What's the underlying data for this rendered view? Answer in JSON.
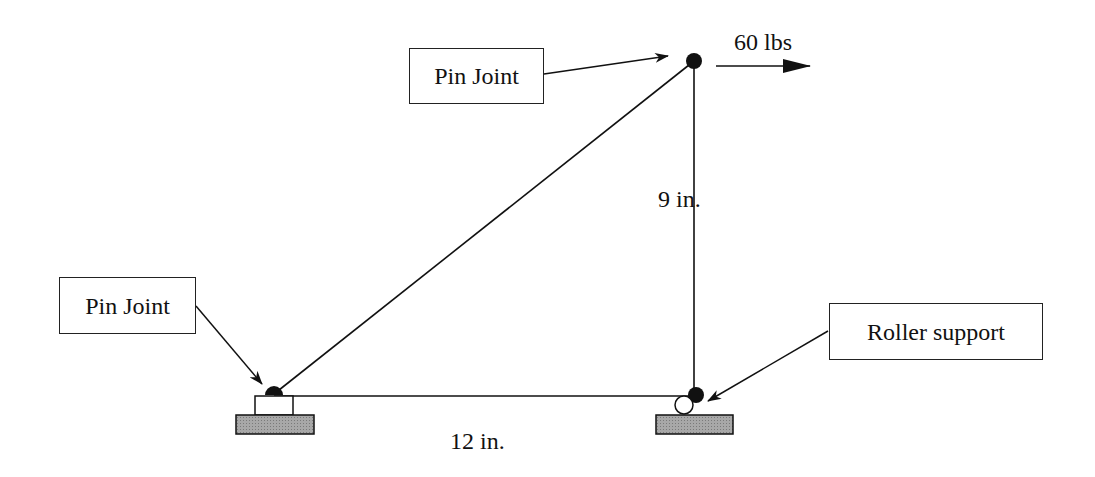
{
  "diagram": {
    "labels": {
      "top_pin": "Pin Joint",
      "left_pin": "Pin Joint",
      "roller": "Roller support"
    },
    "load": {
      "text": "60 lbs",
      "direction": "right"
    },
    "dimensions": {
      "vertical": "9 in.",
      "horizontal": "12 in."
    },
    "nodes": [
      {
        "id": "A",
        "type": "pin-support",
        "x": 274,
        "y": 395
      },
      {
        "id": "B",
        "type": "roller-support",
        "x": 694,
        "y": 395
      },
      {
        "id": "C",
        "type": "pin-joint",
        "x": 694,
        "y": 60
      }
    ],
    "members": [
      {
        "from": "A",
        "to": "C"
      },
      {
        "from": "C",
        "to": "B"
      },
      {
        "from": "A",
        "to": "B"
      }
    ],
    "colors": {
      "line": "#111111",
      "ground": "#9a9a9a"
    }
  }
}
